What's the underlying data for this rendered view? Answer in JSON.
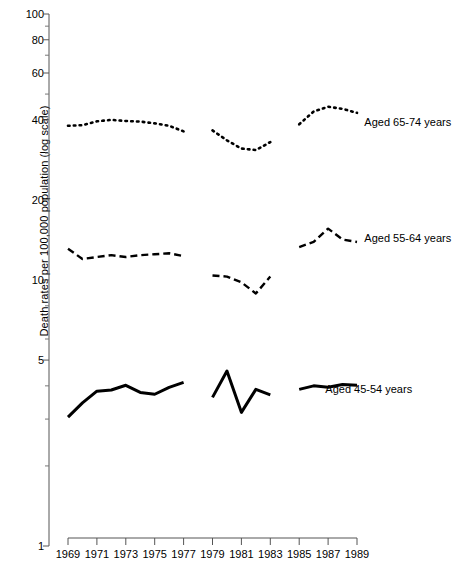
{
  "chart_data": {
    "type": "line",
    "title": "",
    "xlabel": "",
    "ylabel": "Death rates per 100,000 population (log scale)",
    "yscale": "log",
    "ylim": [
      1,
      100
    ],
    "yticks": [
      1,
      5,
      10,
      20,
      40,
      60,
      80,
      100
    ],
    "ytick_labels": [
      "1",
      "5",
      "10",
      "20",
      "40",
      "60",
      "80",
      "100"
    ],
    "xlim": [
      1969,
      1989
    ],
    "xticks": [
      1969,
      1971,
      1973,
      1975,
      1977,
      1979,
      1981,
      1983,
      1985,
      1987,
      1989
    ],
    "xtick_labels": [
      "1969",
      "1971",
      "1973",
      "1975",
      "1977",
      "1979",
      "1981",
      "1983",
      "1985",
      "1987",
      "1989"
    ],
    "x": [
      1969,
      1970,
      1971,
      1972,
      1973,
      1974,
      1975,
      1976,
      1977,
      1978,
      1979,
      1980,
      1981,
      1982,
      1983,
      1984,
      1985,
      1986,
      1987,
      1988,
      1989
    ],
    "grid": false,
    "legend_position": "right-inline",
    "breaks_after": [
      1977,
      1983
    ],
    "series": [
      {
        "name": "Aged 65-74 years",
        "style": "dotted",
        "color": "#000000",
        "label_x": 1989.3,
        "label_y": 39.0,
        "values": [
          38.0,
          38.2,
          39.5,
          40.0,
          39.6,
          39.4,
          38.8,
          38.0,
          36.2,
          null,
          36.5,
          33.5,
          31.2,
          30.8,
          33.0,
          null,
          38.5,
          43.0,
          44.8,
          44.0,
          42.5
        ]
      },
      {
        "name": "Aged 55-64 years",
        "style": "dashed",
        "color": "#000000",
        "label_x": 1989.3,
        "label_y": 14.3,
        "values": [
          13.1,
          12.0,
          12.2,
          12.4,
          12.2,
          12.4,
          12.5,
          12.6,
          12.3,
          null,
          10.4,
          10.3,
          9.8,
          8.9,
          10.3,
          null,
          13.3,
          13.9,
          15.6,
          14.2,
          13.9
        ]
      },
      {
        "name": "Aged 45-54 years",
        "style": "solid",
        "color": "#000000",
        "label_x": 1986.6,
        "label_y": 3.85,
        "values": [
          3.05,
          3.45,
          3.82,
          3.86,
          4.02,
          3.78,
          3.72,
          3.95,
          4.12,
          null,
          3.62,
          4.55,
          3.18,
          3.88,
          3.7,
          null,
          3.88,
          4.0,
          3.95,
          4.05,
          4.02
        ]
      }
    ]
  }
}
